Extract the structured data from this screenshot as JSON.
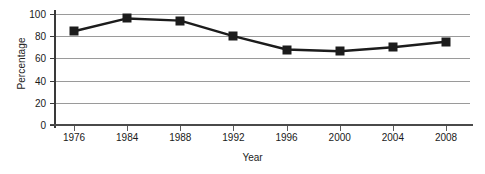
{
  "chart_data": {
    "type": "line",
    "title": "",
    "xlabel": "Year",
    "ylabel": "Percentage",
    "categories": [
      "1976",
      "1984",
      "1988",
      "1992",
      "1996",
      "2000",
      "2004",
      "2008"
    ],
    "values": [
      84.5,
      96,
      94,
      80,
      68,
      66.5,
      70,
      75
    ],
    "series": [
      {
        "name": "Percentage",
        "values": [
          84.5,
          96,
          94,
          80,
          68,
          66.5,
          70,
          75
        ]
      }
    ],
    "ylim": [
      0,
      100
    ],
    "yticks": [
      0,
      20,
      40,
      60,
      80,
      100
    ],
    "ytick_labels": [
      "0",
      "20",
      "40",
      "60",
      "80",
      "100"
    ],
    "grid": "horizontal",
    "legend": "none",
    "marker": "square",
    "line_color": "#1c1c1c",
    "marker_color": "#1c1c1c",
    "grid_color": "#9a9a9a",
    "axis_color": "#3a3a3a",
    "background": "#ffffff"
  }
}
